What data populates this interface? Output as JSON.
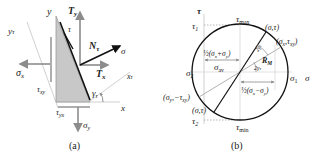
{
  "figure_a": {
    "caption": "(a)",
    "labels": {
      "y": "y",
      "y_tau": "y",
      "y_tau_sub": "τ",
      "T_y": "T",
      "T_y_sub": "y",
      "tau": "τ",
      "N_tau": "N",
      "N_tau_sub": "τ",
      "sigma": "σ",
      "sigma_x": "σ",
      "sigma_x_sub": "x",
      "T_x": "T",
      "T_x_sub": "x",
      "x_tau": "x",
      "x_tau_sub": "τ",
      "tau_xy": "τ",
      "tau_xy_sub": "xy",
      "gamma_tau": "γ",
      "gamma_tau_sub": "τ",
      "x": "x",
      "tau_yx": "τ",
      "tau_yx_sub": "yx",
      "sigma_y": "σ",
      "sigma_y_sub": "y"
    },
    "colors": {
      "fill": "#c8c8c8",
      "arrow_gray": "#8c8c8c",
      "arrow_black": "#111111",
      "axis_light": "#c4c4c4"
    }
  },
  "figure_b": {
    "caption": "(b)",
    "labels": {
      "tau_axis": "τ",
      "tau_1": "τ",
      "tau_1_sub": "1",
      "tau_max": "τ",
      "tau_max_sub": "max",
      "point_sigma_tau_top": "(σ,τ)",
      "point_sigma_x_tau_xy": "(σ",
      "point_sigma_x_tau_xy_sub1": "x",
      "point_sigma_x_tau_xy_mid": ",τ",
      "point_sigma_x_tau_xy_sub2": "xy",
      "point_sigma_x_tau_xy_end": ")",
      "half_sum": "½(σ",
      "half_sum_sub1": "x",
      "half_sum_mid": "+σ",
      "half_sum_sub2": "y",
      "half_sum_end": ")",
      "sigma_av": "σ",
      "sigma_av_sub": "av",
      "angle_2gamma": "2γ",
      "angle_2gamma_sub": "τ",
      "angle_2gamma_t": "2γ",
      "angle_2gamma_t_sub": "τ",
      "R_M": "R",
      "R_M_sub": "M",
      "sigma_2": "σ",
      "sigma_2_sub": "2",
      "sigma_1": "σ",
      "sigma_1_sub": "1",
      "sigma_axis": "σ",
      "half_diff": "½(σ",
      "half_diff_sub1": "x",
      "half_diff_mid": "−σ",
      "half_diff_sub2": "y",
      "half_diff_end": ")",
      "point_sigma_y_neg_tau_xy": "(σ",
      "point_sigma_y_neg_tau_xy_sub1": "y",
      "point_sigma_y_neg_tau_xy_mid": ",−τ",
      "point_sigma_y_neg_tau_xy_sub2": "xy",
      "point_sigma_y_neg_tau_xy_end": ")",
      "point_sigma_tau_bottom": "(σ,τ)",
      "tau_2": "τ",
      "tau_2_sub": "2",
      "tau_min": "τ",
      "tau_min_sub": "min"
    },
    "colors": {
      "circle": "#111111",
      "dashed": "#999999",
      "gray_line": "#a8a8a8",
      "arrow_gray": "#8c8c8c"
    }
  }
}
